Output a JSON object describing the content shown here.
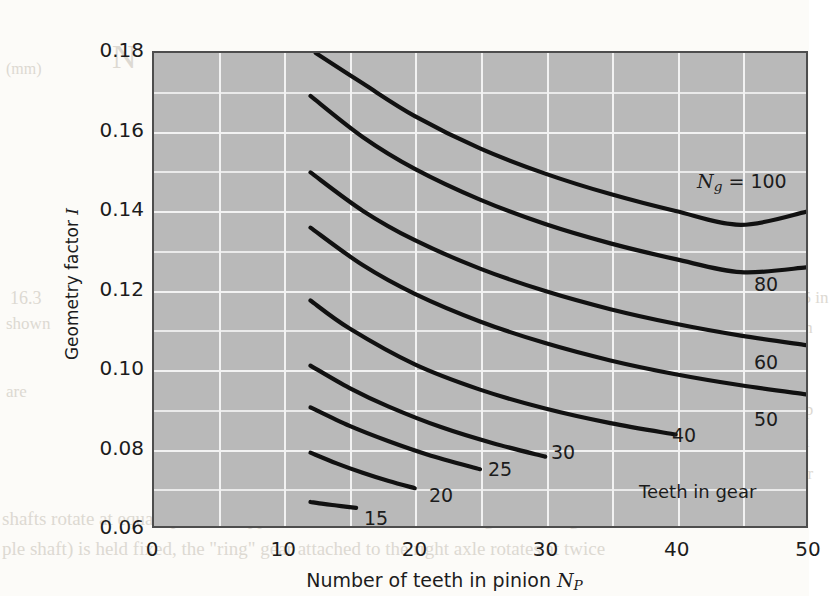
{
  "chart_data": {
    "type": "line",
    "title": "",
    "xlabel": "Number of teeth in pinion N_P",
    "ylabel": "Geometry factor I",
    "xlim": [
      0,
      50
    ],
    "ylim": [
      0.06,
      0.18
    ],
    "x_major_ticks": [
      0,
      10,
      20,
      30,
      40,
      50
    ],
    "x_minor_ticks": [
      5,
      15,
      25,
      35,
      45
    ],
    "y_major_ticks": [
      0.06,
      0.08,
      0.1,
      0.12,
      0.14,
      0.16,
      0.18
    ],
    "y_minor_ticks": [
      0.07,
      0.09,
      0.11,
      0.13,
      0.15,
      0.17
    ],
    "x_tick_labels": [
      "0",
      "10",
      "20",
      "30",
      "40",
      "50"
    ],
    "y_tick_labels": [
      "0.06",
      "0.08",
      "0.10",
      "0.12",
      "0.14",
      "0.16",
      "0.18"
    ],
    "grid": true,
    "grid_color": "#f2f2f2",
    "plot_bg": "#b9b9b9",
    "line_color": "#111111",
    "legend": "none",
    "annotation": "Teeth in gear",
    "head_label": "N_g = 100",
    "series": [
      {
        "name": "15",
        "label": "15",
        "x": [
          12,
          13,
          14,
          15,
          15.5
        ],
        "values": [
          0.0661,
          0.0656,
          0.0652,
          0.0648,
          0.0646
        ]
      },
      {
        "name": "20",
        "label": "20",
        "x": [
          12,
          14,
          16,
          18,
          20
        ],
        "values": [
          0.0786,
          0.0759,
          0.0735,
          0.0714,
          0.0696
        ]
      },
      {
        "name": "25",
        "label": "25",
        "x": [
          12,
          15,
          18,
          21,
          25
        ],
        "values": [
          0.0901,
          0.0854,
          0.0815,
          0.0781,
          0.0744
        ]
      },
      {
        "name": "30",
        "label": "30",
        "x": [
          12,
          15,
          18,
          22,
          26,
          30
        ],
        "values": [
          0.1007,
          0.095,
          0.0903,
          0.0851,
          0.081,
          0.0776
        ]
      },
      {
        "name": "40",
        "label": "40",
        "x": [
          12,
          15,
          20,
          25,
          30,
          35,
          40
        ],
        "values": [
          0.1172,
          0.1101,
          0.101,
          0.0946,
          0.0898,
          0.0861,
          0.0832
        ]
      },
      {
        "name": "50",
        "label": "50",
        "x": [
          12,
          16,
          20,
          25,
          30,
          35,
          40,
          45,
          50
        ],
        "values": [
          0.1357,
          0.1262,
          0.1189,
          0.1119,
          0.1064,
          0.102,
          0.0985,
          0.0957,
          0.0934
        ]
      },
      {
        "name": "60",
        "label": "60",
        "x": [
          12,
          16,
          20,
          25,
          30,
          35,
          40,
          45,
          50
        ],
        "values": [
          0.1497,
          0.14,
          0.1325,
          0.1253,
          0.1196,
          0.115,
          0.1113,
          0.1083,
          0.1059
        ]
      },
      {
        "name": "80",
        "label": "80",
        "x": [
          12,
          16,
          20,
          25,
          30,
          35,
          40,
          45,
          50
        ],
        "values": [
          0.1691,
          0.1587,
          0.1506,
          0.1428,
          0.1366,
          0.1317,
          0.1277,
          0.1244,
          0.1256
        ]
      },
      {
        "name": "100",
        "label": "100",
        "x": [
          12.4,
          16,
          20,
          25,
          30,
          35,
          40,
          45,
          50
        ],
        "values": [
          0.18,
          0.1723,
          0.164,
          0.1558,
          0.1494,
          0.1442,
          0.1399,
          0.1364,
          0.1397
        ]
      }
    ]
  },
  "axes": {
    "y_title_prefix": "Geometry factor ",
    "y_title_symbol": "I",
    "x_title_prefix": "Number of teeth in pinion ",
    "x_title_symbol": "N",
    "x_title_subscript": "P"
  },
  "head_label": {
    "symbol": "N",
    "subscript": "g",
    "equals": " = 100"
  },
  "curve_labels": [
    {
      "text": "15",
      "left": 322,
      "top": 489
    },
    {
      "text": "20",
      "left": 387,
      "top": 466
    },
    {
      "text": "25",
      "left": 446,
      "top": 440
    },
    {
      "text": "30",
      "left": 509,
      "top": 423
    },
    {
      "text": "40",
      "left": 630,
      "top": 406
    },
    {
      "text": "50",
      "left": 712,
      "top": 390
    },
    {
      "text": "60",
      "left": 712,
      "top": 333
    },
    {
      "text": "80",
      "left": 712,
      "top": 255
    }
  ],
  "annotation": {
    "text": "Teeth in gear",
    "left": 597,
    "top": 463
  },
  "bleed_text": [
    {
      "text": "(mm)",
      "left": 6,
      "top": 60,
      "size": 16
    },
    {
      "text": "N",
      "left": 112,
      "top": 38,
      "size": 34
    },
    {
      "text": "16.3",
      "left": 10,
      "top": 288,
      "size": 18
    },
    {
      "text": "shown",
      "left": 6,
      "top": 314,
      "size": 17
    },
    {
      "text": "are",
      "left": 6,
      "top": 382,
      "size": 17
    },
    {
      "text": "Figure 16",
      "left": 186,
      "top": 380,
      "size": 19
    },
    {
      "text": "sun and ring",
      "left": 186,
      "top": 408,
      "size": 19
    },
    {
      "text": "is relat",
      "left": 186,
      "top": 436,
      "size": 19
    },
    {
      "text": "shafts rotate at equal speeds in opposite directions. If the \"sun\" gear in the ge",
      "left": 2,
      "top": 508,
      "size": 19
    },
    {
      "text": "ple shaft) is held fixed, the \"ring\" gear attached to the right axle rotates at twice",
      "left": 2,
      "top": 538,
      "size": 19
    },
    {
      "text": "(0.5 in",
      "left": 784,
      "top": 288,
      "size": 17
    },
    {
      "text": "is in",
      "left": 784,
      "top": 318,
      "size": 17
    },
    {
      "text": "amp",
      "left": 784,
      "top": 400,
      "size": 17
    },
    {
      "text": "whi",
      "left": 784,
      "top": 432,
      "size": 17
    },
    {
      "text": "gear",
      "left": 784,
      "top": 464,
      "size": 17
    }
  ]
}
